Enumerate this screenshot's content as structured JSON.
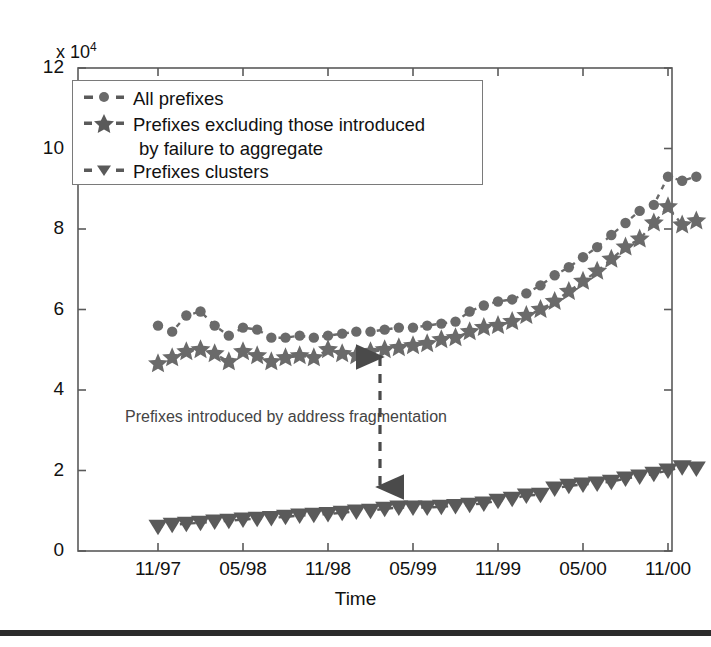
{
  "figure": {
    "axis_multiplier": "x 10",
    "axis_multiplier_exp": "4",
    "xlabel": "Time",
    "annotation": "Prefixes introduced by address fragmentation"
  },
  "legend": {
    "items": [
      {
        "label": "All prefixes",
        "marker": "circle-marker",
        "continuation": ""
      },
      {
        "label": "Prefixes excluding those introduced",
        "marker": "star-marker",
        "continuation": "by failure to aggregate"
      },
      {
        "label": "Prefixes clusters",
        "marker": "triangle-down-marker",
        "continuation": ""
      }
    ]
  },
  "chart_data": {
    "type": "line",
    "title": "",
    "xlabel": "Time",
    "ylabel": "",
    "y_multiplier": 10000,
    "xlim": [
      "11/97",
      "01/01"
    ],
    "ylim": [
      0,
      12
    ],
    "grid": false,
    "legend_position": "upper-left",
    "xtick_labels": [
      "11/97",
      "05/98",
      "11/98",
      "05/99",
      "11/99",
      "05/00",
      "11/00"
    ],
    "ytick_labels": [
      "0",
      "2",
      "4",
      "6",
      "8",
      "10",
      "12"
    ],
    "x": [
      "11/97",
      "12/97",
      "01/98",
      "02/98",
      "03/98",
      "04/98",
      "05/98",
      "06/98",
      "07/98",
      "08/98",
      "09/98",
      "10/98",
      "11/98",
      "12/98",
      "01/99",
      "02/99",
      "03/99",
      "04/99",
      "05/99",
      "06/99",
      "07/99",
      "08/99",
      "09/99",
      "10/99",
      "11/99",
      "12/99",
      "01/00",
      "02/00",
      "03/00",
      "04/00",
      "05/00",
      "06/00",
      "07/00",
      "08/00",
      "09/00",
      "10/00",
      "11/00",
      "12/00",
      "01/01"
    ],
    "series": [
      {
        "name": "All prefixes",
        "marker": "circle",
        "linestyle": "dashed",
        "color": "#6a6a6a",
        "values": [
          5.6,
          5.45,
          5.85,
          5.95,
          5.6,
          5.35,
          5.55,
          5.5,
          5.3,
          5.3,
          5.35,
          5.3,
          5.35,
          5.4,
          5.45,
          5.45,
          5.5,
          5.55,
          5.55,
          5.6,
          5.65,
          5.7,
          5.95,
          6.1,
          6.2,
          6.25,
          6.4,
          6.6,
          6.85,
          7.05,
          7.3,
          7.55,
          7.85,
          8.15,
          8.45,
          8.6,
          9.3,
          9.2,
          9.3
        ]
      },
      {
        "name": "Prefixes excluding those introduced by failure to aggregate",
        "marker": "star",
        "linestyle": "dashed",
        "color": "#6a6a6a",
        "values": [
          4.65,
          4.8,
          4.95,
          5.0,
          4.9,
          4.7,
          4.95,
          4.85,
          4.7,
          4.8,
          4.85,
          4.8,
          5.0,
          4.9,
          4.85,
          4.95,
          5.0,
          5.05,
          5.1,
          5.15,
          5.25,
          5.3,
          5.45,
          5.55,
          5.6,
          5.7,
          5.85,
          6.0,
          6.2,
          6.45,
          6.7,
          6.95,
          7.25,
          7.55,
          7.75,
          8.15,
          8.55,
          8.1,
          8.2
        ]
      },
      {
        "name": "Prefixes clusters",
        "marker": "triangle-down",
        "linestyle": "dashed",
        "color": "#5a5a5a",
        "values": [
          0.6,
          0.65,
          0.68,
          0.7,
          0.73,
          0.75,
          0.78,
          0.8,
          0.82,
          0.85,
          0.88,
          0.9,
          0.92,
          0.95,
          0.98,
          1.0,
          1.05,
          1.08,
          1.08,
          1.08,
          1.1,
          1.12,
          1.15,
          1.18,
          1.25,
          1.3,
          1.38,
          1.4,
          1.55,
          1.62,
          1.65,
          1.68,
          1.72,
          1.8,
          1.85,
          1.92,
          2.0,
          2.08,
          2.05
        ]
      }
    ],
    "annotations": [
      {
        "text": "Prefixes introduced by address fragmentation",
        "arrow": "double-headed-vertical",
        "x": "04/99",
        "y_from": 5.1,
        "y_to": 1.1
      }
    ]
  }
}
